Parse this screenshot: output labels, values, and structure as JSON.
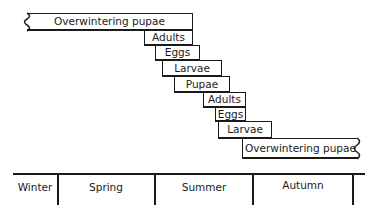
{
  "diagram": {
    "title": "",
    "stages": [
      {
        "label": "Overwintering pupae",
        "x": 27,
        "y": 13,
        "w": 166,
        "h": 18,
        "open": "left"
      },
      {
        "label": "Adults",
        "x": 144,
        "y": 30,
        "w": 49,
        "h": 16
      },
      {
        "label": "Eggs",
        "x": 155,
        "y": 45,
        "w": 45,
        "h": 16
      },
      {
        "label": "Larvae",
        "x": 162,
        "y": 60,
        "w": 60,
        "h": 17
      },
      {
        "label": "Pupae",
        "x": 174,
        "y": 76,
        "w": 56,
        "h": 17
      },
      {
        "label": "Adults",
        "x": 203,
        "y": 93,
        "w": 43,
        "h": 15
      },
      {
        "label": "Eggs",
        "x": 215,
        "y": 107,
        "w": 31,
        "h": 15
      },
      {
        "label": "Larvae",
        "x": 218,
        "y": 121,
        "w": 54,
        "h": 18
      },
      {
        "label": "Overwintering pupae",
        "x": 242,
        "y": 139,
        "w": 116,
        "h": 20,
        "open": "right"
      }
    ],
    "seasons": [
      {
        "label": "Winter",
        "x": 13,
        "w": 44
      },
      {
        "label": "Spring",
        "x": 57,
        "w": 98
      },
      {
        "label": "Summer",
        "x": 155,
        "w": 98
      },
      {
        "label": "Autumn",
        "x": 253,
        "w": 100
      }
    ],
    "dividers": [
      57,
      155,
      253,
      353
    ]
  }
}
